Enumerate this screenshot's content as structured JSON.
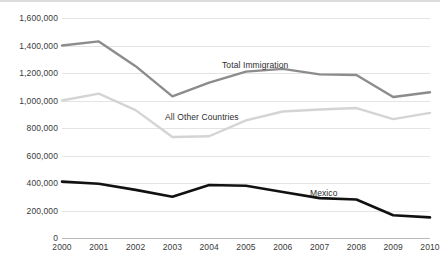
{
  "chart_data": {
    "type": "line",
    "title": "",
    "xlabel": "",
    "ylabel": "",
    "x": [
      "2000",
      "2001",
      "2002",
      "2003",
      "2004",
      "2005",
      "2006",
      "2007",
      "2008",
      "2009",
      "2010"
    ],
    "categories": [
      "2000",
      "2001",
      "2002",
      "2003",
      "2004",
      "2005",
      "2006",
      "2007",
      "2008",
      "2009",
      "2010"
    ],
    "ylim": [
      0,
      1600000
    ],
    "y_ticks": [
      0,
      200000,
      400000,
      600000,
      800000,
      1000000,
      1200000,
      1400000,
      1600000
    ],
    "y_tick_labels": [
      "0",
      "200,000",
      "400,000",
      "600,000",
      "800,000",
      "1,000,000",
      "1,200,000",
      "1,400,000",
      "1,600,000"
    ],
    "grid": true,
    "legend": "inline-annotations",
    "series": [
      {
        "name": "Total Immigration",
        "color": "#8c8c8c",
        "values": [
          1400000,
          1430000,
          1250000,
          1030000,
          1130000,
          1210000,
          1230000,
          1190000,
          1185000,
          1025000,
          1060000
        ]
      },
      {
        "name": "All Other Countries",
        "color": "#d4d4d4",
        "values": [
          1000000,
          1050000,
          930000,
          735000,
          740000,
          855000,
          920000,
          935000,
          945000,
          865000,
          910000
        ]
      },
      {
        "name": "Mexico",
        "color": "#111111",
        "values": [
          410000,
          395000,
          350000,
          300000,
          385000,
          380000,
          335000,
          290000,
          280000,
          165000,
          150000
        ]
      }
    ],
    "annotations": [
      {
        "text": "Total Immigration",
        "series": "Total Immigration",
        "x_px": 222,
        "y_px": 60
      },
      {
        "text": "All Other Countries",
        "series": "All Other Countries",
        "x_px": 165,
        "y_px": 112
      },
      {
        "text": "Mexico",
        "series": "Mexico",
        "x_px": 310,
        "y_px": 188
      }
    ]
  }
}
